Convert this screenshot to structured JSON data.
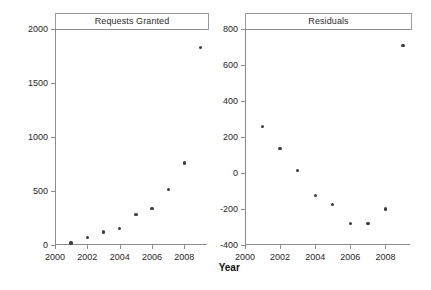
{
  "figure": {
    "x_axis_title": "Year",
    "background": "#ffffff",
    "marker_color": "#3d3d3d",
    "axis_color": "#8c8c8c"
  },
  "chart_data": [
    {
      "type": "scatter",
      "title": "Requests Granted",
      "xlabel": "Year",
      "ylabel": "",
      "x": [
        2001,
        2002,
        2003,
        2004,
        2005,
        2006,
        2007,
        2008,
        2009
      ],
      "values": [
        20,
        70,
        120,
        155,
        280,
        340,
        515,
        760,
        1830
      ],
      "xlim": [
        2000,
        2009.4
      ],
      "ylim": [
        0,
        2000
      ],
      "xticks": [
        2000,
        2002,
        2004,
        2006,
        2008
      ],
      "xticklabels": [
        "2000",
        "2002",
        "2004",
        "2006",
        "2008"
      ],
      "yticks": [
        0,
        500,
        1000,
        1500,
        2000
      ],
      "yticklabels": [
        "0",
        "500",
        "1000",
        "1500",
        "2000"
      ],
      "grid": false,
      "legend": false
    },
    {
      "type": "scatter",
      "title": "Residuals",
      "xlabel": "Year",
      "ylabel": "",
      "x": [
        2001,
        2002,
        2003,
        2004,
        2005,
        2006,
        2007,
        2008,
        2009
      ],
      "values": [
        258,
        135,
        15,
        -125,
        -175,
        -280,
        -280,
        -200,
        710
      ],
      "xlim": [
        2000,
        2009.4
      ],
      "ylim": [
        -400,
        800
      ],
      "xticks": [
        2000,
        2002,
        2004,
        2006,
        2008
      ],
      "xticklabels": [
        "2000",
        "2002",
        "2004",
        "2006",
        "2008"
      ],
      "yticks": [
        -400,
        -200,
        0,
        200,
        400,
        600,
        800
      ],
      "yticklabels": [
        "-400",
        "-200",
        "0",
        "200",
        "400",
        "600",
        "800"
      ],
      "grid": false,
      "legend": false
    }
  ]
}
